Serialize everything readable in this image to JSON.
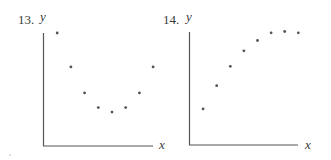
{
  "chart_data": [
    {
      "type": "scatter",
      "title": "13.",
      "xlabel": "x",
      "ylabel": "y",
      "grid": false,
      "ticks": false,
      "x": [
        1,
        2,
        3,
        4,
        5,
        6,
        7,
        8
      ],
      "y": [
        10,
        7,
        4.7,
        3.4,
        3,
        3.4,
        4.7,
        7
      ],
      "description": "U-shaped (parabolic) pattern: points decrease to a minimum then increase"
    },
    {
      "type": "scatter",
      "title": "14.",
      "xlabel": "x",
      "ylabel": "y",
      "grid": false,
      "ticks": false,
      "x": [
        1,
        2,
        3,
        4,
        5,
        6,
        7,
        8
      ],
      "y": [
        2.8,
        4.6,
        6.1,
        7.3,
        8.1,
        8.7,
        8.8,
        8.7
      ],
      "description": "Concave-down increasing pattern leveling off"
    }
  ],
  "plots": [
    {
      "number": "13.",
      "ylabel": "y",
      "xlabel": "x"
    },
    {
      "number": "14.",
      "ylabel": "y",
      "xlabel": "x"
    }
  ]
}
